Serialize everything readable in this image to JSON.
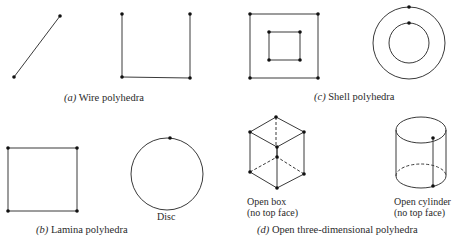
{
  "figure": {
    "panels": [
      {
        "id": "a",
        "letter": "(a)",
        "caption": "Wire polyhedra",
        "shapes": [
          "line-segment",
          "open-square-three-edges"
        ]
      },
      {
        "id": "b",
        "letter": "(b)",
        "caption": "Lamina polyhedra",
        "shapes": [
          "square",
          "disc"
        ],
        "shape_labels": {
          "disc": "Disc"
        }
      },
      {
        "id": "c",
        "letter": "(c)",
        "caption": "Shell polyhedra",
        "shapes": [
          "nested-squares",
          "concentric-circles"
        ]
      },
      {
        "id": "d",
        "letter": "(d)",
        "caption": "Open three-dimensional polyhedra",
        "shapes": [
          "open-box",
          "open-cylinder"
        ],
        "shape_labels": {
          "open_box": "Open box",
          "open_box_note": "(no top face)",
          "open_cylinder": "Open cylinder",
          "open_cylinder_note": "(no top face)"
        }
      }
    ],
    "colors": {
      "line": "#3a3a3a",
      "vertex": "#111111",
      "text": "#2a2a2a"
    }
  }
}
